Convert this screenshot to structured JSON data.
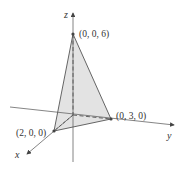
{
  "figure": {
    "type": "3d-tetrahedron-plane",
    "axes": {
      "x": {
        "label": "x"
      },
      "y": {
        "label": "y"
      },
      "z": {
        "label": "z"
      }
    },
    "points": [
      {
        "id": "z-intercept",
        "label": "(0, 0, 6)",
        "coords": [
          0,
          0,
          6
        ]
      },
      {
        "id": "y-intercept",
        "label": "(0, 3, 0)",
        "coords": [
          0,
          3,
          0
        ]
      },
      {
        "id": "x-intercept",
        "label": "(2, 0, 0)",
        "coords": [
          2,
          0,
          0
        ]
      }
    ],
    "colors": {
      "face_fill": "#e3e3e3",
      "edge": "#555555",
      "axis": "#555555",
      "text": "#333333"
    }
  }
}
